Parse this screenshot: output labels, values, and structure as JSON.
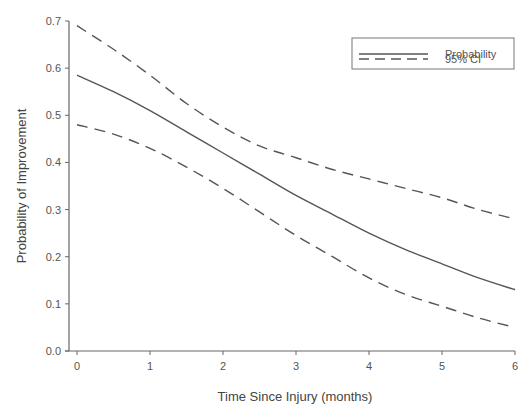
{
  "chart_data": {
    "type": "line",
    "title": "",
    "xlabel": "Time Since Injury (months)",
    "ylabel": "Probability of Improvement",
    "xlim": [
      0,
      6
    ],
    "ylim": [
      0.0,
      0.7
    ],
    "x_ticks": [
      "0",
      "1",
      "2",
      "3",
      "4",
      "5",
      "6"
    ],
    "y_ticks": [
      "0.0",
      "0.1",
      "0.2",
      "0.3",
      "0.4",
      "0.5",
      "0.6",
      "0.7"
    ],
    "grid": false,
    "legend_position": "upper right",
    "x": [
      0,
      0.5,
      1,
      1.5,
      2,
      2.5,
      3,
      3.5,
      4,
      4.5,
      5,
      5.5,
      6
    ],
    "series": [
      {
        "name": "Probability",
        "style": "solid",
        "values": [
          0.585,
          0.55,
          0.51,
          0.465,
          0.42,
          0.375,
          0.33,
          0.29,
          0.25,
          0.215,
          0.185,
          0.155,
          0.13
        ]
      },
      {
        "name": "95% CI (upper)",
        "style": "dashed",
        "values": [
          0.69,
          0.64,
          0.585,
          0.525,
          0.475,
          0.435,
          0.41,
          0.385,
          0.365,
          0.345,
          0.325,
          0.3,
          0.28
        ]
      },
      {
        "name": "95% CI (lower)",
        "style": "dashed",
        "values": [
          0.48,
          0.46,
          0.43,
          0.39,
          0.345,
          0.295,
          0.245,
          0.2,
          0.155,
          0.12,
          0.095,
          0.07,
          0.05
        ]
      }
    ],
    "legend": [
      {
        "label": "Probability",
        "style": "solid"
      },
      {
        "label": "95% CI",
        "style": "dashed"
      }
    ]
  },
  "colors": {
    "line": "#555555",
    "axis": "#666666",
    "text": "#555555"
  }
}
